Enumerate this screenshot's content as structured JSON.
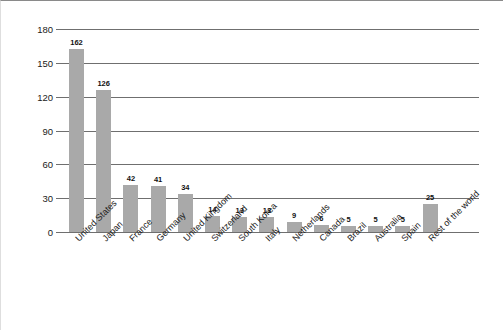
{
  "chart_data": {
    "type": "bar",
    "title": "",
    "subtitle": "",
    "xlabel": "",
    "ylabel": "Number of corporations",
    "ylim": [
      0,
      180
    ],
    "yticks": [
      0,
      30,
      60,
      90,
      120,
      150,
      180
    ],
    "grid": true,
    "legend": false,
    "legend_position": "none",
    "bar_color": "#a9a9a9",
    "gridline_color": "#6f6f6f",
    "value_labels": true,
    "categories": [
      "United States",
      "Japan",
      "France",
      "Germany",
      "United Kingdom",
      "Switzerland",
      "South Korea",
      "Italy",
      "Netherlands",
      "Canada",
      "Brazil",
      "Australia",
      "Spain",
      "Rest of the world"
    ],
    "values": [
      162,
      126,
      42,
      41,
      34,
      14,
      13,
      13,
      9,
      6,
      5,
      5,
      5,
      25
    ]
  }
}
